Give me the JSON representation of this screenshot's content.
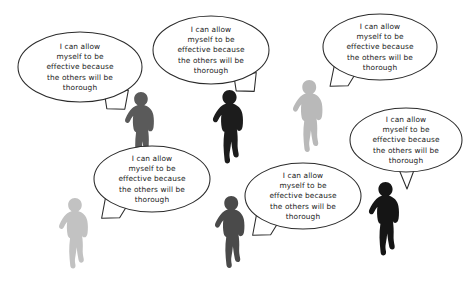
{
  "scene": {
    "title": "Team members speech bubbles illustration",
    "background_color": "#ffffff",
    "width": 474,
    "height": 287,
    "bubble_fill": "#ffffff",
    "bubble_stroke": "#2b2b2b"
  },
  "bubbles": [
    {
      "id": "bubble-top-left",
      "text": "I can allow\nmyself to be\neffective because\nthe others will be\nthorough",
      "cx": 80,
      "cy": 67,
      "rx": 62,
      "ry": 35,
      "tail": "down-right-jagged",
      "speaker": "figure-dark-gray-upper-left"
    },
    {
      "id": "bubble-top-center",
      "text": "I can allow\nmyself to be\neffective because\nthe others will be\nthorough",
      "cx": 211,
      "cy": 50,
      "rx": 58,
      "ry": 34,
      "tail": "down-right-jagged",
      "speaker": "figure-black-upper-center"
    },
    {
      "id": "bubble-top-right",
      "text": "I can allow\nmyself to be\neffective because\nthe others will be\nthorough",
      "cx": 380,
      "cy": 47,
      "rx": 57,
      "ry": 33,
      "tail": "down-left-jagged",
      "speaker": "figure-light-gray-upper-right"
    },
    {
      "id": "bubble-right-middle",
      "text": "I can allow\nmyself to be\neffective because\nthe others will be\nthorough",
      "cx": 406,
      "cy": 140,
      "rx": 56,
      "ry": 32,
      "tail": "down-triangle",
      "speaker": "figure-black-lower-right"
    },
    {
      "id": "bubble-bottom-left",
      "text": "I can allow\nmyself to be\neffective because\nthe others will be\nthorough",
      "cx": 152,
      "cy": 179,
      "rx": 58,
      "ry": 33,
      "tail": "down-left-jagged",
      "speaker": "figure-light-gray-lower-left"
    },
    {
      "id": "bubble-bottom-center",
      "text": "I can allow\nmyself to be\neffective because\nthe others will be\nthorough",
      "cx": 303,
      "cy": 196,
      "rx": 58,
      "ry": 33,
      "tail": "down-left-jagged",
      "speaker": "figure-dark-gray-lower-center"
    }
  ],
  "figures": [
    {
      "id": "figure-dark-gray-upper-left",
      "x": 128,
      "y": 92,
      "scale": 0.96,
      "color": "#5a5a5a",
      "facing": "left"
    },
    {
      "id": "figure-black-upper-center",
      "x": 216,
      "y": 90,
      "scale": 1.0,
      "color": "#1c1c1c",
      "facing": "left"
    },
    {
      "id": "figure-light-gray-upper-right",
      "x": 296,
      "y": 80,
      "scale": 0.98,
      "color": "#b9b9b9",
      "facing": "left"
    },
    {
      "id": "figure-light-gray-lower-left",
      "x": 62,
      "y": 198,
      "scale": 0.96,
      "color": "#c2c2c2",
      "facing": "left"
    },
    {
      "id": "figure-dark-gray-lower-center",
      "x": 218,
      "y": 196,
      "scale": 0.98,
      "color": "#4a4a4a",
      "facing": "left"
    },
    {
      "id": "figure-black-lower-right",
      "x": 372,
      "y": 182,
      "scale": 1.0,
      "color": "#151515",
      "facing": "left"
    }
  ]
}
